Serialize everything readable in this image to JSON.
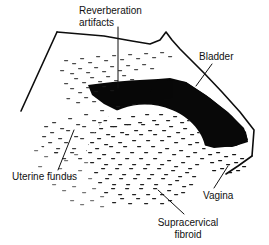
{
  "figure": {
    "kind": "ultrasound-line-illustration",
    "modality": "pelvic ultrasound sector scan",
    "background_color": "#ffffff",
    "ink_color": "#111111",
    "bladder_fill": "#080808",
    "labels": [
      {
        "id": "reverberation-artifacts",
        "line1": "Reverberation",
        "line2": "artifacts",
        "align": "start",
        "x": 79,
        "y": 11,
        "leader": "vertical line descending into the anechoic bladder"
      },
      {
        "id": "bladder",
        "line1": "Bladder",
        "line2": "",
        "align": "start",
        "x": 199,
        "y": 57,
        "leader": "short diagonal leader to lower left"
      },
      {
        "id": "uterine-fundus",
        "line1": "Uterine fundus",
        "line2": "",
        "align": "start",
        "x": 12,
        "y": 177,
        "leader": "thin diagonal leader rising to the right"
      },
      {
        "id": "vagina",
        "line1": "Vagina",
        "line2": "",
        "align": "start",
        "x": 203,
        "y": 196,
        "leader": "short diagonal leader rising to the right"
      },
      {
        "id": "supracervical-fibroid",
        "line1": "Supracervical",
        "line2": "fibroid",
        "align": "middle",
        "x": 188,
        "y": 223,
        "leader": "diagonal leader rising to the upper left into the mass"
      }
    ],
    "structures": [
      {
        "id": "scan-sector-outline",
        "desc": "open fan outline of the transducer sector"
      },
      {
        "id": "bladder-region",
        "desc": "solid black anechoic urine-filled bladder"
      },
      {
        "id": "uterine-fundus-tissue",
        "desc": "medium speckled echogenic myometrium"
      },
      {
        "id": "supracervical-fibroid-mass",
        "desc": "dense rounded heterogeneous hypoechoic mass"
      },
      {
        "id": "vagina-stripe",
        "desc": "bright linear echo complex at lower right"
      },
      {
        "id": "reverberation-streaks",
        "desc": "sparse near-field horizontal dash artifacts"
      }
    ]
  }
}
